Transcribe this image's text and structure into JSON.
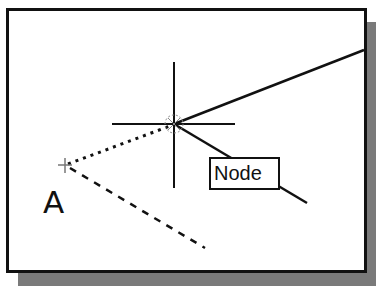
{
  "figure": {
    "point_label": "A",
    "snap_tooltip": "Node",
    "cursor": "crosshair",
    "snap_marker": "node-osnap-marker"
  },
  "colors": {
    "line": "#111111",
    "background": "#ffffff",
    "shadow": "#7a7a7a"
  }
}
